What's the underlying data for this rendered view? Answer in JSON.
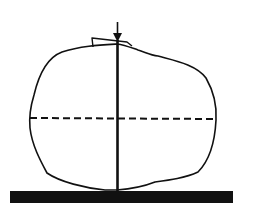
{
  "diagram": {
    "colors": {
      "stroke": "#111111",
      "base": "#111111",
      "background": "#ffffff"
    },
    "elements": {
      "arrow": {
        "x": 117,
        "y_start": 22,
        "y_end": 42
      },
      "vertical_axis": {
        "x": 117,
        "y_start": 40,
        "y_end": 191
      },
      "dashed_midline": {
        "y": 118,
        "x_start": 30,
        "x_end": 217
      },
      "base_bar": {
        "x": 10,
        "y": 191,
        "width": 223,
        "height": 12
      }
    }
  }
}
